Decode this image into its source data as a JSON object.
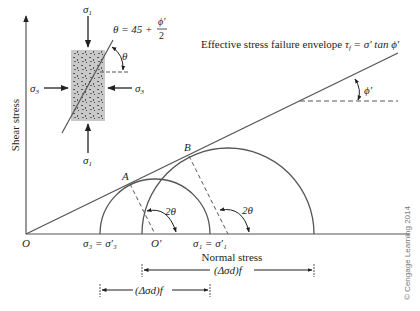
{
  "axes": {
    "y_label": "Shear stress",
    "x_label": "Normal stress",
    "origin_label": "O"
  },
  "envelope": {
    "label_prefix": "Effective stress failure envelope ",
    "equation_lhs": "τ",
    "equation_sub": "f",
    "equation_rhs": " = σ′ tan ϕ′",
    "angle_label": "ϕ′"
  },
  "specimen": {
    "sigma1_top": "σ",
    "sigma1_top_sub": "1",
    "sigma1_bottom": "σ",
    "sigma1_bottom_sub": "1",
    "sigma3_left": "σ",
    "sigma3_left_sub": "3",
    "sigma3_right": "σ",
    "sigma3_right_sub": "3",
    "theta_label": "θ",
    "theta_eq": "θ = 45 +",
    "theta_frac_num": "ϕ′",
    "theta_frac_den": "2"
  },
  "mohr": {
    "point_a": "A",
    "point_b": "B",
    "center_label": "O′",
    "angle_small": "2θ",
    "angle_large": "2θ",
    "sigma3_label": "σ₃ = σ′₃",
    "sigma1_label": "σ₁ = σ′₁"
  },
  "dimensions": {
    "upper": "(Δσd)f",
    "lower": "(Δσd)f"
  },
  "copyright": "© Cengage Learning 2014"
}
